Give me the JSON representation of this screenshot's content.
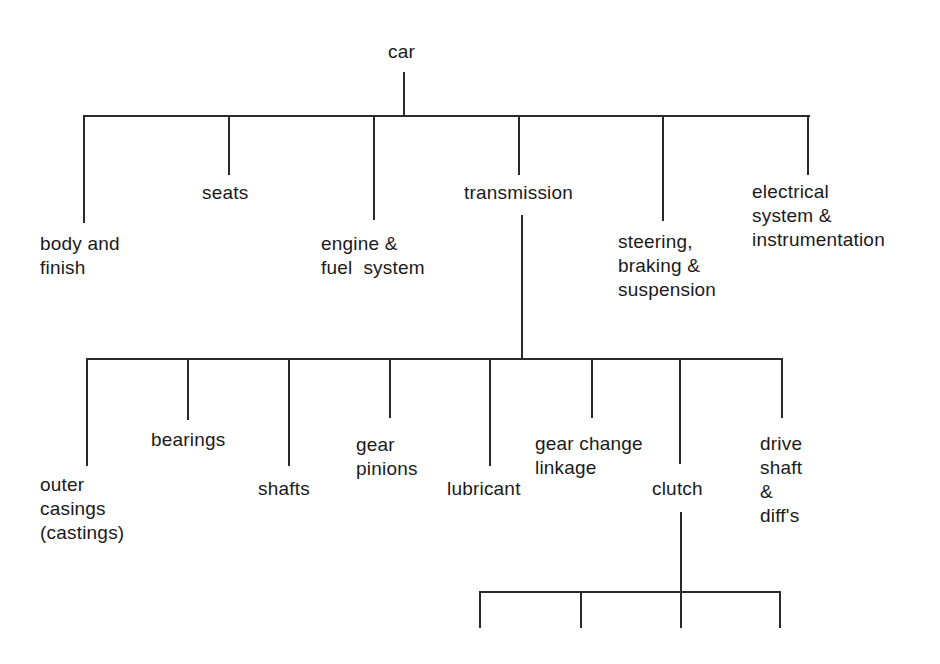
{
  "diagram": {
    "type": "tree",
    "root": {
      "label": "car"
    },
    "level1": [
      {
        "label": "body and\nfinish"
      },
      {
        "label": "seats"
      },
      {
        "label": "engine &\nfuel  system"
      },
      {
        "label": "transmission"
      },
      {
        "label": "steering,\nbraking &\nsuspension"
      },
      {
        "label": "electrical\nsystem &\ninstrumentation"
      }
    ],
    "level2_transmission": [
      {
        "label": "outer\ncasings\n(castings)"
      },
      {
        "label": "bearings"
      },
      {
        "label": "shafts"
      },
      {
        "label": "gear\npinions"
      },
      {
        "label": "lubricant"
      },
      {
        "label": "gear change\nlinkage"
      },
      {
        "label": "clutch"
      },
      {
        "label": "drive\nshaft\n&\ndiff's"
      }
    ],
    "level3_clutch_branches": 4,
    "line_color": "#2a2a2a"
  }
}
